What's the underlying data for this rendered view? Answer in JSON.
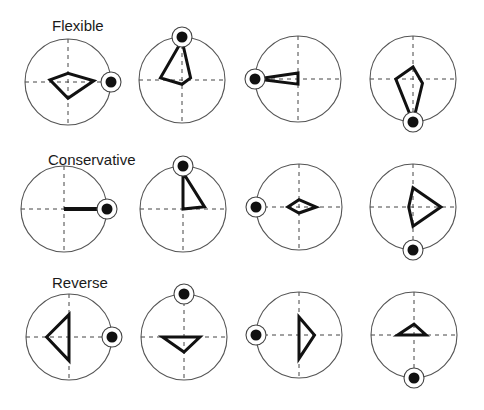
{
  "figure": {
    "axes": "dashed crosshair (horizontal and vertical)",
    "coordinate_note": "polygon vertices normalized to circle radius = 1, x right, y up"
  },
  "rows": [
    {
      "label": "Flexible",
      "plots": [
        {
          "marker": "right",
          "kind": "polygon",
          "points": [
            [
              -0.42,
              0.05
            ],
            [
              0,
              0.2
            ],
            [
              0.6,
              0.03
            ],
            [
              0,
              -0.38
            ]
          ]
        },
        {
          "marker": "top",
          "kind": "polygon",
          "points": [
            [
              0,
              0.92
            ],
            [
              -0.5,
              0.05
            ],
            [
              0,
              -0.1
            ],
            [
              0.2,
              0.05
            ]
          ]
        },
        {
          "marker": "left",
          "kind": "polygon",
          "points": [
            [
              -0.95,
              0
            ],
            [
              0,
              0.14
            ],
            [
              0,
              -0.12
            ]
          ]
        },
        {
          "marker": "bottom",
          "kind": "polygon",
          "points": [
            [
              0,
              0.28
            ],
            [
              -0.4,
              0
            ],
            [
              0,
              -1.0
            ],
            [
              0.22,
              -0.1
            ]
          ]
        }
      ]
    },
    {
      "label": "Conservative",
      "plots": [
        {
          "marker": "right",
          "kind": "line",
          "points": [
            [
              0,
              0
            ],
            [
              0.95,
              0
            ]
          ]
        },
        {
          "marker": "top",
          "kind": "polygon",
          "points": [
            [
              0,
              0.85
            ],
            [
              0,
              0
            ],
            [
              0.5,
              0.05
            ]
          ]
        },
        {
          "marker": "left",
          "kind": "polygon",
          "points": [
            [
              -0.26,
              0
            ],
            [
              0,
              0.17
            ],
            [
              0.4,
              0
            ],
            [
              0,
              -0.14
            ]
          ]
        },
        {
          "marker": "bottom",
          "kind": "polygon",
          "points": [
            [
              0,
              0.45
            ],
            [
              0.65,
              0
            ],
            [
              0,
              -0.45
            ],
            [
              -0.1,
              0
            ]
          ]
        }
      ]
    },
    {
      "label": "Reverse",
      "plots": [
        {
          "marker": "right",
          "kind": "polygon",
          "points": [
            [
              0,
              0.52
            ],
            [
              -0.52,
              0
            ],
            [
              0,
              -0.55
            ]
          ]
        },
        {
          "marker": "top",
          "kind": "polygon",
          "points": [
            [
              -0.5,
              0
            ],
            [
              0.37,
              0
            ],
            [
              0,
              -0.35
            ]
          ]
        },
        {
          "marker": "left",
          "kind": "polygon",
          "points": [
            [
              0,
              0.42
            ],
            [
              0.36,
              0
            ],
            [
              0,
              -0.55
            ]
          ]
        },
        {
          "marker": "bottom",
          "kind": "polygon",
          "points": [
            [
              -0.38,
              0
            ],
            [
              0,
              0.25
            ],
            [
              0.28,
              0
            ]
          ]
        }
      ]
    }
  ],
  "colors": {
    "stroke": "#111111",
    "circle": "#555555",
    "background": "#ffffff"
  }
}
